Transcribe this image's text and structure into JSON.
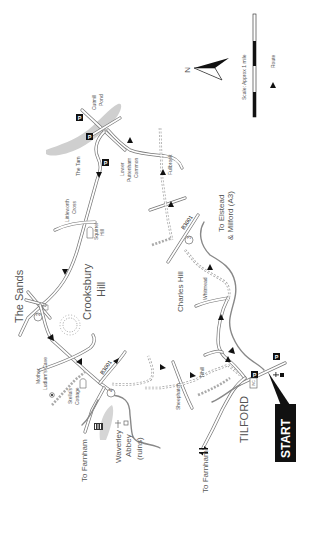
{
  "map": {
    "title": "Tilford circular walk map",
    "north_label": "N",
    "scale_label": "Scale: Approx 1 mile",
    "legend_route_label": "Route",
    "start_label": "START",
    "places": {
      "cutmill_pond_1": "Cutmill",
      "cutmill_pond_2": "Pond",
      "the_tarn": "The Tarn",
      "lower_puttenham_1": "Lower",
      "lower_puttenham_2": "Puttenham",
      "lower_puttenham_3": "Common",
      "fullbrook": "Fullbrook",
      "littleworth_1": "Littleworth",
      "littleworth_2": "Cross",
      "squirrel_1": "Squirrel",
      "squirrel_2": "Hill",
      "the_sands": "The Sands",
      "crooksbury_1": "Crooksbury",
      "crooksbury_2": "Hill",
      "b3001_north": "B3001",
      "b3001_south": "B3001",
      "to_elstead_1": "To Elstead",
      "to_elstead_2": "& Milford (A3)",
      "charles_hill": "Charles Hill",
      "whitmead": "Whitmead",
      "mother_ludlam_1": "Mother",
      "mother_ludlam_2": "Ludlam's Cave",
      "stellas_1": "Stella's",
      "stellas_2": "Cottage",
      "to_farnham_road": "To Farnham",
      "waverley_1": "Waverley",
      "waverley_2": "Abbey",
      "waverley_3": "(ruins)",
      "sheephatch": "Sheephatch",
      "tilhill": "Tilhill",
      "to_farnham_rail": "To Farnham",
      "tilford": "TILFORD",
      "wc": "WC"
    },
    "waypoints": [
      "2",
      "3",
      "4"
    ],
    "parking_label": "P",
    "colors": {
      "road": "#777777",
      "water": "#cccccc",
      "start_box": "#111111",
      "text": "#555555"
    }
  }
}
